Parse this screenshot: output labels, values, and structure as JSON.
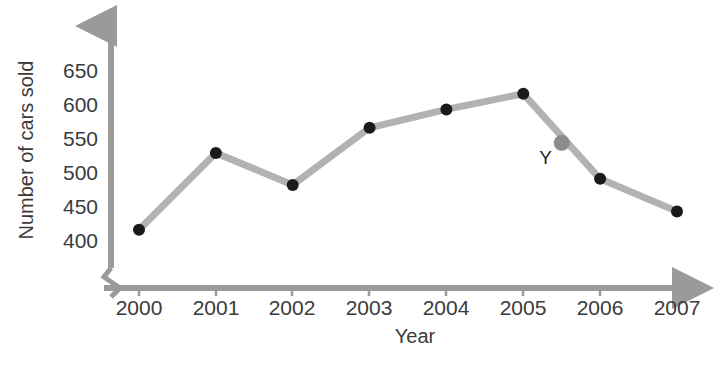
{
  "chart_data": {
    "type": "line",
    "title": "",
    "xlabel": "Year",
    "ylabel": "Number of cars sold",
    "categories": [
      "2000",
      "2001",
      "2002",
      "2003",
      "2004",
      "2005",
      "2006",
      "2007"
    ],
    "x": [
      2000,
      2001,
      2002,
      2003,
      2004,
      2005,
      2006,
      2007
    ],
    "values": [
      415,
      528,
      481,
      565,
      592,
      615,
      490,
      442
    ],
    "ytick_labels": [
      "400",
      "450",
      "500",
      "550",
      "600",
      "650"
    ],
    "yticks": [
      400,
      450,
      500,
      550,
      600,
      650
    ],
    "ylim": [
      375,
      672
    ],
    "xlim": [
      2000,
      2007
    ],
    "grid": false,
    "legend": false,
    "axis_break": true,
    "annotations": [
      {
        "label": "Y",
        "x": 2005.5,
        "value": 543,
        "marker": "gray-dot",
        "label_position": "left"
      }
    ],
    "colors": {
      "line": "#b2b2b2",
      "marker": "#1a1a1a",
      "axis": "#9a9a9a",
      "annotation_marker": "#8c8c8c",
      "text": "#3b3b3b",
      "background": "#ffffff"
    }
  },
  "axis_labels": {
    "x_title": "Year",
    "y_title": "Number of cars sold"
  }
}
